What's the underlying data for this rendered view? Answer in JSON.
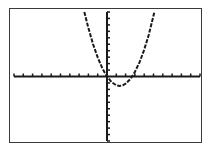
{
  "screen": {
    "type": "graphing-calculator-display",
    "frame_color": "#3a3a3a",
    "ink_color": "#1a1a1a",
    "background": "#ffffff"
  },
  "chart_data": {
    "type": "line",
    "title": "",
    "xlabel": "",
    "ylabel": "",
    "xlim": [
      -10,
      10
    ],
    "ylim": [
      -10,
      10
    ],
    "xscl": 1,
    "yscl": 1,
    "grid": false,
    "axes": true,
    "series": [
      {
        "name": "Y1",
        "equation": "y = 0.8x(x - 2.7)",
        "roots": [
          0,
          2.7
        ],
        "vertex": [
          1.35,
          -1.46
        ],
        "x": [
          -2.44,
          -2,
          -1.5,
          -1,
          -0.5,
          0,
          0.5,
          1,
          1.35,
          1.7,
          2,
          2.5,
          2.7,
          3,
          3.5,
          4,
          4.5,
          5.1
        ],
        "y": [
          10,
          7.52,
          5.04,
          2.96,
          1.28,
          0,
          -0.88,
          -1.36,
          -1.46,
          -1.36,
          -1.12,
          -0.4,
          0,
          0.72,
          2.24,
          4.16,
          6.48,
          10
        ]
      }
    ]
  }
}
